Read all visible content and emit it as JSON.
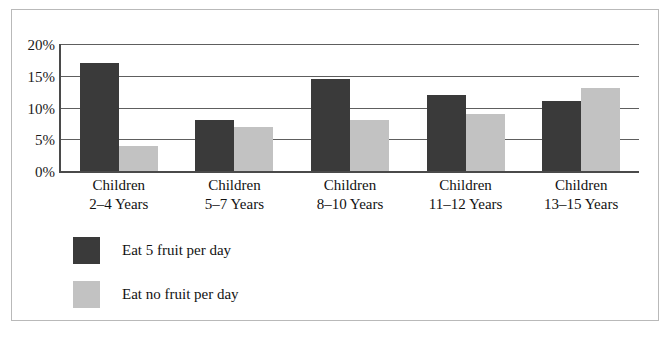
{
  "chart_data": {
    "type": "bar",
    "title": "",
    "subtitle": "",
    "xlabel": "",
    "ylabel": "",
    "ylim": [
      0,
      20
    ],
    "ytick_values": [
      20,
      15,
      10,
      5,
      0
    ],
    "ytick_labels": [
      "20%",
      "15%",
      "10%",
      "5%",
      "0%"
    ],
    "grid": true,
    "legend_position": "below-left",
    "categories": [
      "Children 2–4 Years",
      "Children 5–7 Years",
      "Children 8–10 Years",
      "Children 11–12 Years",
      "Children 13–15 Years"
    ],
    "category_lines": [
      {
        "line1": "Children",
        "line2": "2–4 Years"
      },
      {
        "line1": "Children",
        "line2": "5–7 Years"
      },
      {
        "line1": "Children",
        "line2": "8–10 Years"
      },
      {
        "line1": "Children",
        "line2": "11–12 Years"
      },
      {
        "line1": "Children",
        "line2": "13–15 Years"
      }
    ],
    "series": [
      {
        "name": "Eat 5 fruit per day",
        "color": "#3a3a3a",
        "values": [
          17,
          8,
          14.5,
          12,
          11
        ]
      },
      {
        "name": "Eat no fruit per day",
        "color": "#c2c2c2",
        "values": [
          4,
          7,
          8,
          9,
          13
        ]
      }
    ]
  },
  "legend": {
    "items": [
      {
        "label": "Eat 5 fruit per day",
        "color": "#3a3a3a"
      },
      {
        "label": "Eat no fruit per day",
        "color": "#c2c2c2"
      }
    ]
  },
  "colors": {
    "series_dark": "#3a3a3a",
    "series_light": "#c2c2c2",
    "axis": "#4a4a4a",
    "gridline": "#5e5e5e",
    "frame": "#b9b9b9",
    "text": "#121212",
    "background": "#ffffff"
  }
}
